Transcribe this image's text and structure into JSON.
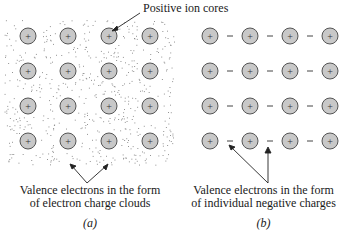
{
  "top_label": "Positive ion cores",
  "panel_a": {
    "caption_line1": "Valence electrons in the form",
    "caption_line2": "of electron charge clouds",
    "tag": "(a)",
    "rows": 4,
    "cols": 4,
    "ion_symbol": "+"
  },
  "panel_b": {
    "caption_line1": "Valence electrons in the form",
    "caption_line2": "of individual negative charges",
    "tag": "(b)",
    "rows": 4,
    "cols": 4,
    "ion_symbol": "+",
    "electron_symbol": "−"
  },
  "colors": {
    "ion_fill": "#c8c8c8",
    "ion_stroke": "#555555",
    "cloud_dots": "#7a7a7a",
    "text": "#1a1a1a"
  }
}
